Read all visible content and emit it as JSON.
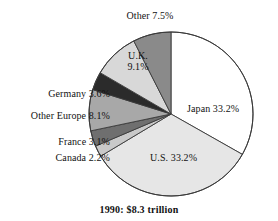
{
  "caption": "1990:  $8.3 trillion",
  "labels": {
    "japan": "Japan 33.2%",
    "us": "U.S. 33.2%",
    "uk_line1": "U.K.",
    "uk_line2": "9.1%",
    "other": "Other 7.5%",
    "germany": "Germany 3.6%",
    "other_europe": "Other Europe 8.1%",
    "france": "France 3.1%",
    "canada": "Canada 2.2%"
  },
  "chart_data": {
    "type": "pie",
    "title": "",
    "subtitle": "1990:  $8.3 trillion",
    "units": "percent",
    "total_value": "$8.3 trillion",
    "year": "1990",
    "start_angle_deg": 0,
    "direction": "clockwise",
    "legend": "none-inline-labels",
    "categories": [
      "Japan",
      "U.S.",
      "Canada",
      "France",
      "Other Europe",
      "Germany",
      "U.K.",
      "Other"
    ],
    "values": [
      33.2,
      33.2,
      2.2,
      3.1,
      8.1,
      3.6,
      9.1,
      7.5
    ],
    "labels": [
      "Japan 33.2%",
      "U.S. 33.2%",
      "Canada 2.2%",
      "France 3.1%",
      "Other Europe 8.1%",
      "Germany 3.6%",
      "U.K. 9.1%",
      "Other 7.5%"
    ],
    "colors": [
      "#ffffff",
      "#e6e6e6",
      "#c9c9c9",
      "#6f6f6f",
      "#a8a8a8",
      "#2b2b2b",
      "#d8d8d8",
      "#8a8a8a"
    ],
    "slices": [
      {
        "name": "Japan",
        "value": 33.2,
        "label": "Japan 33.2%",
        "color": "#ffffff",
        "label_position": "inside"
      },
      {
        "name": "U.S.",
        "value": 33.2,
        "label": "U.S. 33.2%",
        "color": "#e6e6e6",
        "label_position": "inside"
      },
      {
        "name": "Canada",
        "value": 2.2,
        "label": "Canada 2.2%",
        "color": "#c9c9c9",
        "label_position": "outside-left"
      },
      {
        "name": "France",
        "value": 3.1,
        "label": "France 3.1%",
        "color": "#6f6f6f",
        "label_position": "outside-left"
      },
      {
        "name": "Other Europe",
        "value": 8.1,
        "label": "Other Europe 8.1%",
        "color": "#a8a8a8",
        "label_position": "outside-left"
      },
      {
        "name": "Germany",
        "value": 3.6,
        "label": "Germany 3.6%",
        "color": "#2b2b2b",
        "label_position": "outside-left"
      },
      {
        "name": "U.K.",
        "value": 9.1,
        "label": "U.K. 9.1%",
        "color": "#d8d8d8",
        "label_position": "inside"
      },
      {
        "name": "Other",
        "value": 7.5,
        "label": "Other 7.5%",
        "color": "#8a8a8a",
        "label_position": "outside-top"
      }
    ],
    "geometry": {
      "center_x": 171,
      "center_y": 114,
      "radius": 82
    }
  }
}
